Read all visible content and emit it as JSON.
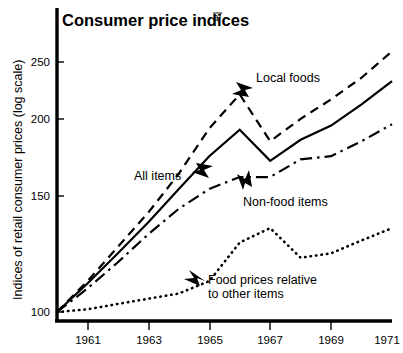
{
  "chart_data": {
    "type": "line",
    "title": "Consumer price indices",
    "title_superscript": "a/",
    "xlabel": "",
    "ylabel": "Indices of retail consumer prices (log scale)",
    "yscale": "log",
    "ylim": [
      95,
      275
    ],
    "xlim": [
      1960,
      1971
    ],
    "yticks": [
      100,
      150,
      200,
      250
    ],
    "ytick_labels": [
      "100",
      "150",
      "200",
      "250"
    ],
    "xticks": [
      1961,
      1963,
      1965,
      1967,
      1969,
      1971
    ],
    "xtick_labels": [
      "1961",
      "1963",
      "1965",
      "1967",
      "1969",
      "1971"
    ],
    "xminor_ticks": [
      1962,
      1964,
      1966,
      1968,
      1970
    ],
    "grid": false,
    "legend": "annotated-inline",
    "x": [
      1960,
      1961,
      1962,
      1963,
      1964,
      1965,
      1966,
      1967,
      1968,
      1969,
      1970,
      1971
    ],
    "series": [
      {
        "name": "Local foods",
        "style": "dashed",
        "values": [
          100,
          112,
          127,
          144,
          166,
          196,
          222,
          187,
          203,
          218,
          236,
          260
        ]
      },
      {
        "name": "All items",
        "style": "solid",
        "values": [
          100,
          111,
          124,
          139,
          157,
          177,
          195,
          174,
          188,
          198,
          214,
          233
        ]
      },
      {
        "name": "Non-food items",
        "style": "dash-dot",
        "values": [
          100,
          109,
          120,
          133,
          146,
          157,
          164,
          164,
          175,
          177,
          187,
          199
        ]
      },
      {
        "name": "Food prices relative to other items",
        "style": "dotted",
        "values": [
          100,
          101,
          103,
          105,
          107,
          112,
          129,
          136,
          122,
          124,
          130,
          136
        ]
      }
    ],
    "annotations": [
      {
        "id": "local-foods",
        "label": "Local foods",
        "target_series": "Local foods",
        "arrow": "left"
      },
      {
        "id": "all-items",
        "label": "All items",
        "target_series": "All items",
        "arrow": "right"
      },
      {
        "id": "non-food-items",
        "label": "Non-food items",
        "target_series": "Non-food items",
        "arrow": "up"
      },
      {
        "id": "food-prices-relative",
        "label_line1": "Food prices relative",
        "label_line2": "to other items",
        "target_series": "Food prices relative to other items",
        "arrow": "up-left"
      }
    ]
  },
  "colors": {
    "ink": "#000000",
    "background": "#ffffff"
  }
}
